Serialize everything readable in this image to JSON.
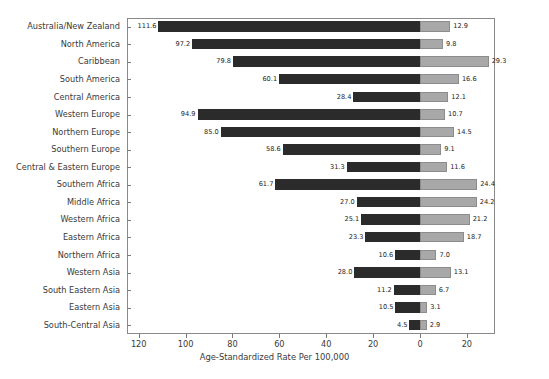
{
  "chart_data": {
    "type": "bar",
    "orientation": "horizontal",
    "layout": "diverging-paired",
    "title": "",
    "xlabel": "Age-Standardized Rate Per 100,000",
    "ylabel": "",
    "grid": false,
    "legend_position": "top-inline",
    "xticks": [
      "120",
      "100",
      "80",
      "60",
      "40",
      "20",
      "0",
      "20"
    ],
    "xtick_values": [
      -120,
      -100,
      -80,
      -60,
      -40,
      -20,
      0,
      20
    ],
    "xlim": [
      -125,
      32
    ],
    "categories": [
      "Australia/New Zealand",
      "North America",
      "Caribbean",
      "South America",
      "Central America",
      "Western Europe",
      "Northern Europe",
      "Southern Europe",
      "Central & Eastern Europe",
      "Southern Africa",
      "Middle Africa",
      "Western Africa",
      "Eastern Africa",
      "Northern Africa",
      "Western Asia",
      "South Eastern Asia",
      "Eastern Asia",
      "South-Central Asia"
    ],
    "series": [
      {
        "name": "Incidence",
        "color": "#2b2b2b",
        "direction": "left",
        "values": [
          111.6,
          97.2,
          79.8,
          60.1,
          28.4,
          94.9,
          85.0,
          58.6,
          31.3,
          61.7,
          27.0,
          25.1,
          23.3,
          10.6,
          28.0,
          11.2,
          10.5,
          4.5
        ]
      },
      {
        "name": "Mortality",
        "color": "#a8a8a8",
        "direction": "right",
        "values": [
          12.9,
          9.8,
          29.3,
          16.6,
          12.1,
          10.7,
          14.5,
          9.1,
          11.6,
          24.4,
          24.2,
          21.2,
          18.7,
          7.0,
          13.1,
          6.7,
          3.1,
          2.9
        ]
      }
    ]
  },
  "headers": {
    "incidence": "Incidence",
    "mortality": "Mortality"
  }
}
